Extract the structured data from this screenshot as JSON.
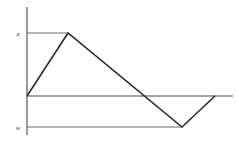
{
  "figure": {
    "background_color": "#ffffff",
    "axis_color": "#4a4a4a",
    "reference_line_color": "#6a6a6a",
    "data_line_color": "#2b2b2b"
  },
  "labels": {
    "upper": "z",
    "lower": "w"
  },
  "chart_data": {
    "type": "line",
    "title": "",
    "xlabel": "",
    "ylabel": "",
    "grid": false,
    "legend": null,
    "xlim": [
      0,
      213
    ],
    "ylim": [
      -31,
      63
    ],
    "axes": {
      "vertical_axis_x": 27,
      "vertical_axis_y_top": 7,
      "vertical_axis_y_bottom": 135,
      "zero_line_y": 96,
      "zero_line_x_start": 27,
      "zero_line_x_end": 233
    },
    "reference_levels": [
      {
        "label": "z",
        "y_pixel": 33,
        "value": 63,
        "x_extent_end": 68
      },
      {
        "label": "w",
        "y_pixel": 127,
        "value": -31,
        "x_extent_end": 182
      }
    ],
    "series": [
      {
        "name": "signal",
        "points_pixel": [
          {
            "x": 27,
            "y": 96
          },
          {
            "x": 68,
            "y": 33
          },
          {
            "x": 182,
            "y": 127
          },
          {
            "x": 215,
            "y": 96
          }
        ],
        "x": [
          0,
          41,
          155,
          188
        ],
        "values": [
          0,
          63,
          -31,
          0
        ]
      }
    ],
    "zero_crossings_pixel": [
      152
    ]
  }
}
